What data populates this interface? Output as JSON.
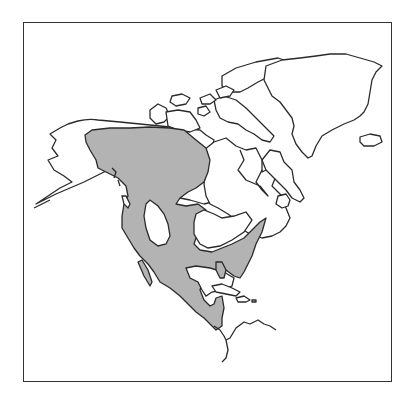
{
  "map": {
    "region": "North America",
    "type": "species range map",
    "frame": {
      "border_color": "#333333",
      "background": "#ffffff"
    },
    "range_fill_color": "#b3b3b3",
    "land_fill_color": "#ffffff",
    "outline_color": "#2a2a2a",
    "features": [
      {
        "name": "alaska",
        "shaded": "partial"
      },
      {
        "name": "canadian-arctic-archipelago",
        "shaded": false
      },
      {
        "name": "greenland",
        "shaded": false
      },
      {
        "name": "iceland",
        "shaded": false
      },
      {
        "name": "hudson-bay",
        "shaded": false
      },
      {
        "name": "western-canada",
        "shaded": true
      },
      {
        "name": "united-states",
        "shaded": "mostly"
      },
      {
        "name": "great-basin-gap",
        "shaded": false
      },
      {
        "name": "great-plains-gap",
        "shaded": false
      },
      {
        "name": "mexico",
        "shaded": true
      },
      {
        "name": "central-america",
        "shaded": "partial"
      },
      {
        "name": "caribbean-islands",
        "shaded": false
      },
      {
        "name": "south-america-north-coast",
        "shaded": false
      }
    ]
  }
}
